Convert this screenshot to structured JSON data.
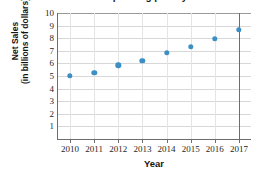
{
  "chart_data": {
    "type": "scatter",
    "title": "The table shows the operating profit y on net sales",
    "xlabel": "Year",
    "ylabel": "Net Sales (in billions of dollars)",
    "ylabel_line1": "Net Sales",
    "ylabel_line2": "(in billions of dollars)",
    "categories": [
      "2010",
      "2011",
      "2012",
      "2013",
      "2014",
      "2015",
      "2016",
      "2017"
    ],
    "x": [
      2010,
      2011,
      2012,
      2013,
      2014,
      2015,
      2016,
      2017
    ],
    "values": [
      5.0,
      5.25,
      5.85,
      6.2,
      6.85,
      7.3,
      7.95,
      8.65
    ],
    "series": [
      {
        "name": "Net Sales",
        "values": [
          5.0,
          5.25,
          5.85,
          6.2,
          6.85,
          7.3,
          7.95,
          8.65
        ]
      }
    ],
    "ylim": [
      0,
      10
    ],
    "xlim": [
      2009.5,
      2017.5
    ],
    "ytick_labels": [
      "10",
      "9",
      "8",
      "7",
      "6",
      "5",
      "4",
      "3",
      "2",
      "1"
    ],
    "ytick_values": [
      10,
      9,
      8,
      7,
      6,
      5,
      4,
      3,
      2,
      1
    ],
    "xtick_labels": [
      "2010",
      "2011",
      "2012",
      "2013",
      "2014",
      "2015",
      "2016",
      "2017"
    ],
    "grid": true,
    "grid_axis": "both",
    "legend": false,
    "legend_position": "none",
    "marker_color": "#3b8fc4",
    "marker_shape": "circle",
    "gridline_color": "#d8d8d8",
    "axis_color": "#6d6d6d",
    "background_color": "#ffffff"
  }
}
